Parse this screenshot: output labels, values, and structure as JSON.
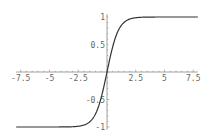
{
  "chart_data": {
    "type": "line",
    "title": "",
    "xlabel": "",
    "ylabel": "",
    "function": "tanh(x)",
    "xlim": [
      -7.9,
      7.9
    ],
    "ylim": [
      -1,
      1
    ],
    "grid": false,
    "x_ticks": [
      -7.5,
      -5,
      -2.5,
      2.5,
      5,
      7.5
    ],
    "x_tick_labels": [
      "-7.5",
      "-5",
      "-2.5",
      "2.5",
      "5",
      "7.5"
    ],
    "y_ticks": [
      1,
      0.5,
      -0.5,
      -1
    ],
    "y_tick_labels": [
      "1",
      "0.5",
      "-0.5",
      "-1"
    ],
    "series": [
      {
        "name": "tanh",
        "x": [
          -7.5,
          -5,
          -2.5,
          -2,
          -1.5,
          -1,
          -0.5,
          0,
          0.5,
          1,
          1.5,
          2,
          2.5,
          5,
          7.5
        ],
        "y": [
          -1.0,
          -1.0,
          -0.987,
          -0.964,
          -0.905,
          -0.762,
          -0.462,
          0,
          0.462,
          0.762,
          0.905,
          0.964,
          0.987,
          1.0,
          1.0
        ]
      }
    ],
    "colors": {
      "curve": "#333333",
      "axis": "#888888",
      "labels": "#666666"
    }
  }
}
